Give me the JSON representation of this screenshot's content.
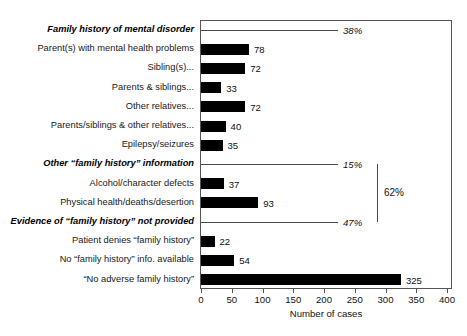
{
  "chart_data": {
    "type": "bar",
    "orientation": "horizontal",
    "title": "",
    "xlabel": "Number of cases",
    "ylabel": "",
    "xlim": [
      0,
      400
    ],
    "xticks": [
      0,
      50,
      100,
      150,
      200,
      250,
      300,
      350,
      400
    ],
    "grid": false,
    "legend": null,
    "categories": [
      "Family history of mental disorder",
      "Parent(s) with mental health problems",
      "Sibling(s)...",
      "Parents & siblings...",
      "Other relatives...",
      "Parents/siblings & other relatives...",
      "Epilepsy/seizures",
      "Other “family history” information",
      "Alcohol/character defects",
      "Physical health/deaths/desertion",
      "Evidence of “family history” not provided",
      "Patient denies “family history”",
      "No “family history” info. available",
      "“No adverse family history”"
    ],
    "values": [
      null,
      78,
      72,
      33,
      72,
      40,
      35,
      null,
      37,
      93,
      null,
      22,
      54,
      325
    ],
    "rows": [
      {
        "label": "Family history of mental disorder",
        "kind": "group",
        "value": null,
        "annotation": "38%"
      },
      {
        "label": "Parent(s) with mental health problems",
        "kind": "bar",
        "value": 78,
        "annotation": "78"
      },
      {
        "label": "Sibling(s)...",
        "kind": "bar",
        "value": 72,
        "annotation": "72"
      },
      {
        "label": "Parents & siblings...",
        "kind": "bar",
        "value": 33,
        "annotation": "33"
      },
      {
        "label": "Other relatives...",
        "kind": "bar",
        "value": 72,
        "annotation": "72"
      },
      {
        "label": "Parents/siblings & other relatives...",
        "kind": "bar",
        "value": 40,
        "annotation": "40"
      },
      {
        "label": "Epilepsy/seizures",
        "kind": "bar",
        "value": 35,
        "annotation": "35"
      },
      {
        "label": "Other “family history” information",
        "kind": "group",
        "value": null,
        "annotation": "15%"
      },
      {
        "label": "Alcohol/character defects",
        "kind": "bar",
        "value": 37,
        "annotation": "37"
      },
      {
        "label": "Physical health/deaths/desertion",
        "kind": "bar",
        "value": 93,
        "annotation": "93"
      },
      {
        "label": "Evidence of “family history” not provided",
        "kind": "group",
        "value": null,
        "annotation": "47%"
      },
      {
        "label": "Patient denies “family history”",
        "kind": "bar",
        "value": 22,
        "annotation": "22"
      },
      {
        "label": "No “family history” info. available",
        "kind": "bar",
        "value": 54,
        "annotation": "54"
      },
      {
        "label": "“No adverse family history”",
        "kind": "bar",
        "value": 325,
        "annotation": "325"
      }
    ],
    "annotations": [
      {
        "name": "group-percent-38",
        "text": "38%",
        "row": 0
      },
      {
        "name": "group-percent-15",
        "text": "15%",
        "row": 7
      },
      {
        "name": "group-percent-47",
        "text": "47%",
        "row": 10
      },
      {
        "name": "bracket-total",
        "text": "62%",
        "spans_rows": [
          7,
          10
        ]
      }
    ],
    "bracket": {
      "label": "62%"
    },
    "colors": {
      "bar": "#000000",
      "frame": "#555555",
      "text": "#111111",
      "background": "#ffffff"
    }
  }
}
